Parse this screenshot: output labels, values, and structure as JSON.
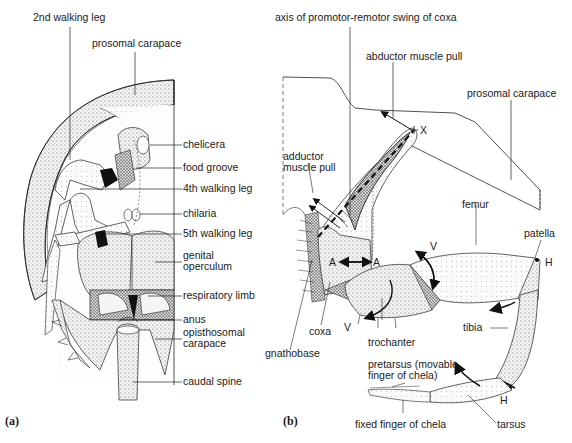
{
  "figure": {
    "panels": [
      {
        "id": "a",
        "panel_label": "(a)",
        "subject": "ventral view of horseshoe crab (prosoma and opisthosoma)",
        "labels": {
          "walking_leg_2": "2nd walking leg",
          "prosomal_carapace": "prosomal carapace",
          "chelicera": "chelicera",
          "food_groove": "food groove",
          "walking_leg_4": "4th walking leg",
          "chilaria": "chilaria",
          "walking_leg_5": "5th walking leg",
          "genital_operculum": "genital\noperculum",
          "respiratory_limb": "respiratory limb",
          "anus": "anus",
          "opisthosomal_carapace": "opisthosomal\ncarapace",
          "caudal_spine": "caudal spine"
        }
      },
      {
        "id": "b",
        "panel_label": "(b)",
        "subject": "walking leg with coxa articulation and muscle pulls",
        "labels": {
          "axis_swing": "axis of promotor-remotor swing of coxa",
          "abductor_pull": "abductor muscle pull",
          "prosomal_carapace": "prosomal carapace",
          "adductor_pull": "adductor\nmuscle pull",
          "femur": "femur",
          "patella": "patella",
          "gnathobase": "gnathobase",
          "coxa": "coxa",
          "trochanter": "trochanter",
          "tibia": "tibia",
          "pretarsus": "pretarsus (movable\nfinger of chela)",
          "fixed_finger": "fixed finger of chela",
          "tarsus": "tarsus"
        },
        "joint_markers": {
          "x_pivot": "X",
          "a_left": "A",
          "a_right": "A",
          "v_top": "V",
          "v_bottom": "V",
          "h_top": "H",
          "h_bottom": "H"
        }
      }
    ]
  }
}
